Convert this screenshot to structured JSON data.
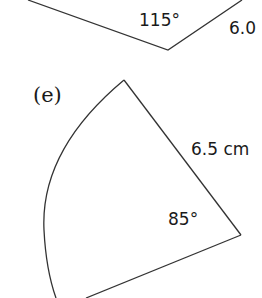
{
  "figure_d": {
    "angle_label": "115°",
    "side_label": "6.0"
  },
  "figure_e": {
    "part_label": "(e)",
    "radius_label": "6.5 cm",
    "angle_label": "85°"
  },
  "colors": {
    "stroke": "#333333",
    "text": "#1a1a1a",
    "background": "#ffffff"
  }
}
